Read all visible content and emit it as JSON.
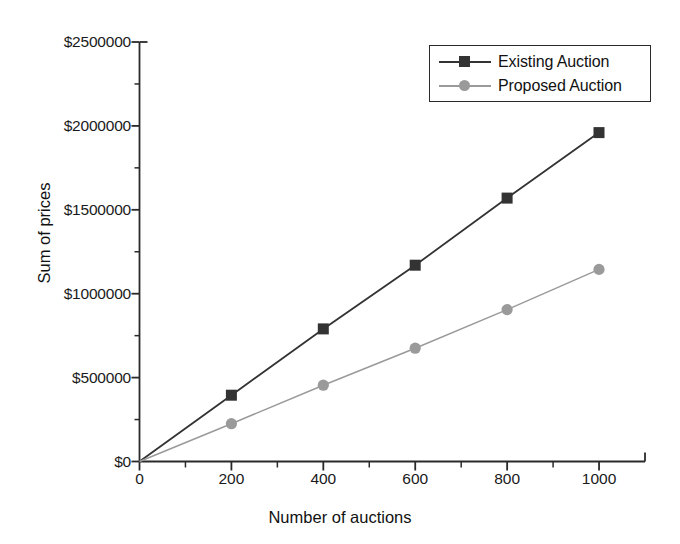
{
  "chart_data": {
    "type": "line",
    "title": "",
    "xlabel": "Number of auctions",
    "ylabel": "Sum of prices",
    "x": [
      0,
      200,
      400,
      600,
      800,
      1000
    ],
    "series": [
      {
        "name": "Existing Auction",
        "values": [
          0,
          395000,
          790000,
          1170000,
          1570000,
          1960000
        ],
        "color": "#333333",
        "marker": "square"
      },
      {
        "name": "Proposed Auction",
        "values": [
          0,
          225000,
          455000,
          675000,
          905000,
          1145000
        ],
        "color": "#9a9a9a",
        "marker": "circle"
      }
    ],
    "xlim": [
      0,
      1100
    ],
    "ylim": [
      0,
      2500000
    ],
    "xticks": [
      0,
      200,
      400,
      600,
      800,
      1000
    ],
    "xtick_labels": [
      "0",
      "200",
      "400",
      "600",
      "800",
      "1000"
    ],
    "xtick_minor_step": 100,
    "yticks": [
      0,
      500000,
      1000000,
      1500000,
      2000000,
      2500000
    ],
    "ytick_labels": [
      "$0",
      "$500000",
      "$1000000",
      "$1500000",
      "$2000000",
      "$2500000"
    ],
    "ytick_minor_step": 250000,
    "grid": false,
    "legend_position": "top-right",
    "legend_entries": [
      "Existing Auction",
      "Proposed Auction"
    ]
  },
  "axes": {
    "x_title": "Number of auctions",
    "y_title": "Sum of prices"
  },
  "legend": {
    "items": [
      {
        "label": "Existing Auction"
      },
      {
        "label": "Proposed Auction"
      }
    ]
  },
  "colors": {
    "existing": "#333333",
    "proposed": "#9a9a9a",
    "axis": "#2a2a2a",
    "text": "#111111",
    "background": "#ffffff"
  }
}
